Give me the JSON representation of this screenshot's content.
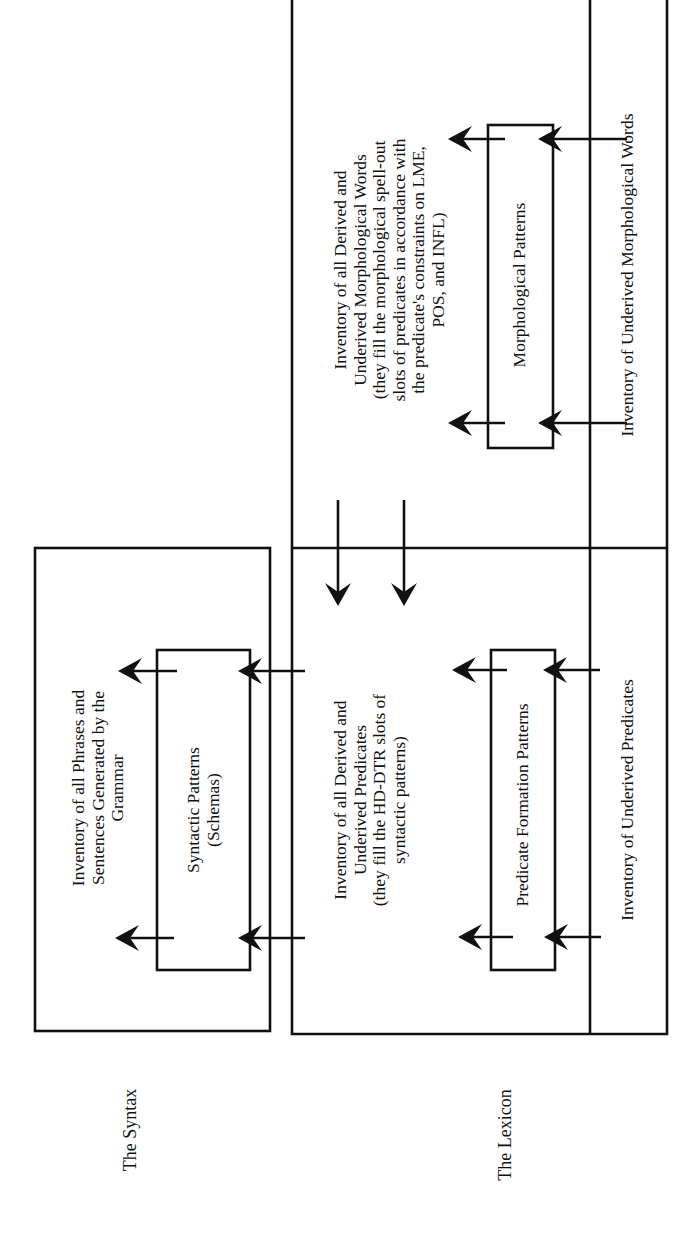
{
  "diagram": {
    "orientation": "rotated 90 degrees counter-clockwise",
    "colors": {
      "line": "#111111",
      "background": "#ffffff"
    },
    "sections": {
      "syntax": {
        "label": "The Syntax",
        "output_inventory": "Inventory of all Phrases and\nSentences Generated by the\nGrammar",
        "patterns_box": "Syntactic Patterns\n(Schemas)"
      },
      "lexicon": {
        "label": "The Lexicon",
        "predicates": {
          "output_inventory": "Inventory of all Derived and\nUnderived Predicates\n(they fill the HD-DTR slots of\nsyntactic patterns)",
          "patterns_box": "Predicate Formation Patterns",
          "input_inventory": "Inventory of Underived Predicates"
        },
        "morphology": {
          "output_inventory": "Inventory of all Derived and\nUnderived Morphological Words\n(they fill the morphological spell-out\nslots of predicates in accordance with\nthe predicate's constraints on LME,\nPOS, and INFL)",
          "patterns_box": "Morphological Patterns",
          "input_inventory": "Inventory of Underived Morphological Words"
        }
      }
    },
    "arrows": [
      {
        "from": "Inventory of Underived Morphological Words",
        "to": "Morphological Patterns",
        "count": 2
      },
      {
        "from": "Morphological Patterns",
        "to": "Inventory of all Derived and Underived Morphological Words",
        "count": 2
      },
      {
        "from": "Inventory of all Derived and Underived Morphological Words",
        "to": "Inventory of all Derived and Underived Predicates",
        "count": 2
      },
      {
        "from": "Inventory of Underived Predicates",
        "to": "Predicate Formation Patterns",
        "count": 2
      },
      {
        "from": "Predicate Formation Patterns",
        "to": "Inventory of all Derived and Underived Predicates",
        "count": 2
      },
      {
        "from": "Inventory of all Derived and Underived Predicates",
        "to": "Syntactic Patterns (Schemas)",
        "count": 2
      },
      {
        "from": "Syntactic Patterns (Schemas)",
        "to": "Inventory of all Phrases and Sentences Generated by the Grammar",
        "count": 2
      }
    ]
  }
}
